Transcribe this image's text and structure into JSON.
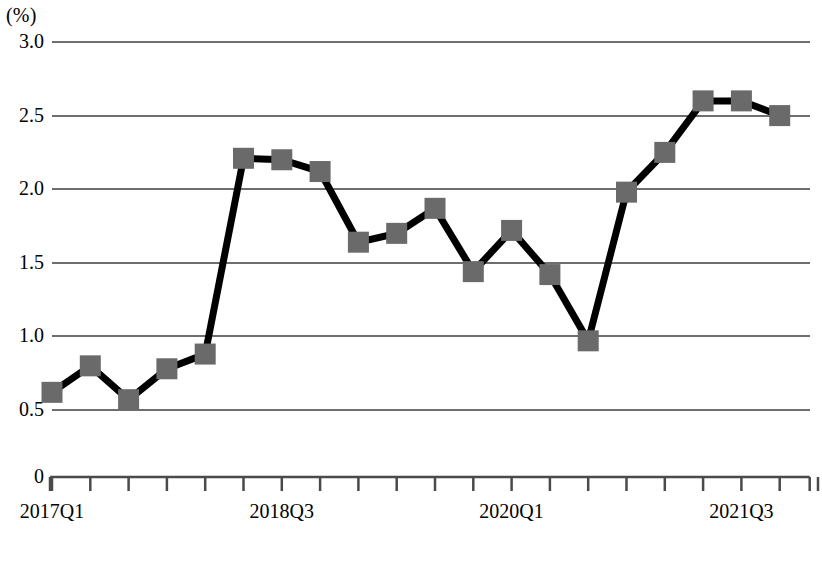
{
  "chart_data": {
    "type": "line",
    "title": "",
    "subtitle": "",
    "xlabel": "",
    "ylabel": "(%)",
    "unit_label": "(%)",
    "ylim": [
      0,
      3.0
    ],
    "y_ticks": [
      "0",
      "0.5",
      "1.0",
      "1.5",
      "2.0",
      "2.5",
      "3.0"
    ],
    "y_tick_values": [
      0,
      0.5,
      1.0,
      1.5,
      2.0,
      2.5,
      3.0
    ],
    "gridlines": [
      0.5,
      1.0,
      1.5,
      2.0,
      2.5,
      3.0
    ],
    "grid": true,
    "legend": "none",
    "x_tick_labels": [
      "2017Q1",
      "2018Q3",
      "2020Q1",
      "2021Q3"
    ],
    "x_tick_label_indices": [
      0,
      6,
      12,
      18
    ],
    "categories": [
      "2017Q1",
      "2017Q2",
      "2017Q3",
      "2017Q4",
      "2018Q1",
      "2018Q2",
      "2018Q3",
      "2018Q4",
      "2019Q1",
      "2019Q2",
      "2019Q3",
      "2019Q4",
      "2020Q1",
      "2020Q2",
      "2020Q3",
      "2020Q4",
      "2021Q1",
      "2021Q2",
      "2021Q3",
      "2021Q4"
    ],
    "values": [
      0.62,
      0.8,
      0.57,
      0.78,
      0.88,
      2.21,
      2.2,
      2.12,
      1.64,
      1.7,
      1.87,
      1.44,
      1.72,
      1.42,
      0.97,
      1.98,
      2.25,
      2.6,
      2.6,
      2.5
    ],
    "series": [
      {
        "name": "series-1",
        "marker": "square",
        "marker_color": "#6a6a6a",
        "line_color": "#000000",
        "values": [
          0.62,
          0.8,
          0.57,
          0.78,
          0.88,
          2.21,
          2.2,
          2.12,
          1.64,
          1.7,
          1.87,
          1.44,
          1.72,
          1.42,
          0.97,
          1.98,
          2.25,
          2.6,
          2.6,
          2.5
        ]
      }
    ]
  },
  "colors": {
    "grid": "#6e6e6e",
    "axis": "#4a4a4a",
    "line": "#000000",
    "marker": "#6a6a6a",
    "background": "#ffffff",
    "text": "#000000"
  }
}
